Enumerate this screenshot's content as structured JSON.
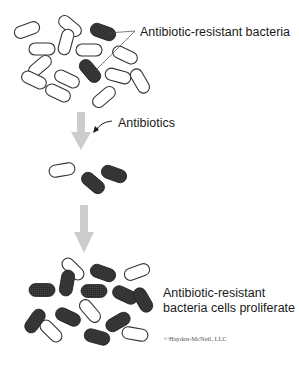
{
  "labels": {
    "resistant_bacteria": "Antibiotic-resistant bacteria",
    "antibiotics": "Antibiotics",
    "proliferate_line1": "Antibiotic-resistant",
    "proliferate_line2": "bacteria cells proliferate",
    "copyright": "©Hayden-McNeil, LLC"
  },
  "colors": {
    "normal_bacteria_fill": "#ffffff",
    "normal_bacteria_stroke": "#333333",
    "resistant_bacteria_fill": "#2e2e2e",
    "arrow_color": "#cccccc",
    "text_color": "#1a1a1a"
  },
  "stages": [
    {
      "name": "initial-population",
      "normal_count": 13,
      "resistant_count": 2
    },
    {
      "name": "after-antibiotics",
      "normal_count": 1,
      "resistant_count": 2
    },
    {
      "name": "proliferation",
      "normal_count": 5,
      "resistant_count": 10
    }
  ]
}
